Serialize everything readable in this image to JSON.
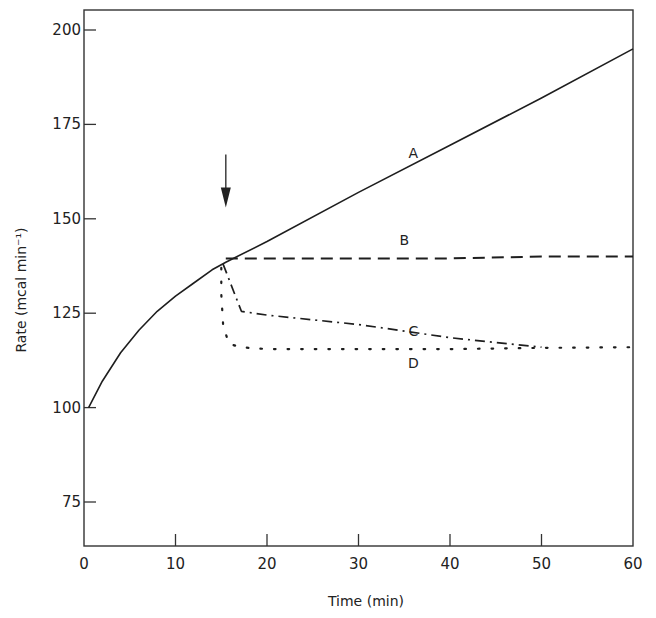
{
  "chart_data": {
    "type": "line",
    "title": "",
    "xlabel": "Time (min)",
    "ylabel": "Rate (mcal min⁻¹)",
    "xlim": [
      0,
      60
    ],
    "ylim": [
      64,
      205
    ],
    "x_ticks": [
      0,
      10,
      20,
      30,
      40,
      50,
      60
    ],
    "y_ticks": [
      75,
      100,
      125,
      150,
      175,
      200
    ],
    "x_tick_labels": [
      "0",
      "10",
      "20",
      "30",
      "40",
      "50",
      "60"
    ],
    "y_tick_labels": [
      "75",
      "100",
      "125",
      "150",
      "175",
      "200"
    ],
    "grid": false,
    "legend": "inline curve labels",
    "annotations": [
      {
        "type": "arrow",
        "x": 15.5,
        "y_from": 167,
        "y_to": 153,
        "direction": "down",
        "label": ""
      }
    ],
    "series": [
      {
        "name": "A",
        "style": "solid",
        "label_pos": [
          36,
          166
        ],
        "points": [
          [
            0.5,
            100
          ],
          [
            2,
            107
          ],
          [
            4,
            114.5
          ],
          [
            6,
            120.5
          ],
          [
            8,
            125.5
          ],
          [
            10,
            129.5
          ],
          [
            12,
            133
          ],
          [
            14,
            136.5
          ],
          [
            15.5,
            138.5
          ],
          [
            20,
            144
          ],
          [
            30,
            157
          ],
          [
            40,
            169.5
          ],
          [
            50,
            182
          ],
          [
            60,
            195
          ]
        ]
      },
      {
        "name": "B",
        "style": "dashed",
        "label_pos": [
          35,
          143
        ],
        "points": [
          [
            15.5,
            139.5
          ],
          [
            20,
            139.5
          ],
          [
            30,
            139.5
          ],
          [
            40,
            139.5
          ],
          [
            50,
            140
          ],
          [
            60,
            140
          ]
        ]
      },
      {
        "name": "C",
        "style": "dash-dot",
        "label_pos": [
          36,
          119
        ],
        "points": [
          [
            15.2,
            138
          ],
          [
            16,
            133
          ],
          [
            17.2,
            125.5
          ],
          [
            20,
            124.5
          ],
          [
            30,
            122
          ],
          [
            40,
            118.5
          ],
          [
            50,
            116
          ]
        ]
      },
      {
        "name": "D",
        "style": "dotted",
        "label_pos": [
          36,
          110.5
        ],
        "points": [
          [
            15,
            137
          ],
          [
            15,
            130
          ],
          [
            15.2,
            122
          ],
          [
            15.8,
            117
          ],
          [
            17,
            116
          ],
          [
            20,
            115.5
          ],
          [
            30,
            115.5
          ],
          [
            40,
            115.5
          ],
          [
            50,
            115.8
          ],
          [
            60,
            116
          ]
        ]
      }
    ]
  }
}
